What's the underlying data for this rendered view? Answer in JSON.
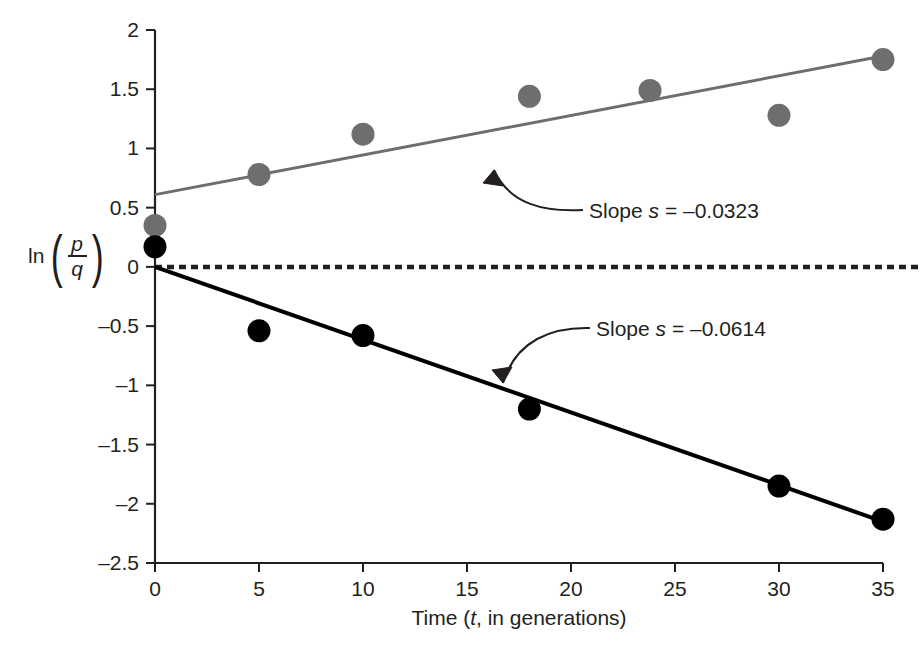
{
  "chart_data": {
    "type": "scatter",
    "title": "",
    "xlabel": "Time (t, in generations)",
    "xlabel_parts": {
      "pre": "Time (",
      "italic": "t",
      "post": ", in generations)"
    },
    "ylabel": "ln(p/q)",
    "ylabel_parts": {
      "fn": "ln",
      "numerator": "p",
      "denominator": "q"
    },
    "xlim": [
      0,
      35
    ],
    "ylim": [
      -2.5,
      2
    ],
    "xticks": [
      0,
      5,
      10,
      15,
      20,
      25,
      30,
      35
    ],
    "xtick_labels": [
      "0",
      "5",
      "10",
      "15",
      "20",
      "25",
      "30",
      "35"
    ],
    "yticks": [
      -2.5,
      -2,
      -1.5,
      -1,
      -0.5,
      0,
      0.5,
      1,
      1.5,
      2
    ],
    "ytick_labels": [
      "-2.5",
      "-2",
      "-1.5",
      "-1",
      "-0.5",
      "0",
      "0.5",
      "1",
      "1.5",
      "2"
    ],
    "grid": false,
    "legend": "none",
    "reference_line": {
      "y": 0,
      "style": "dashed",
      "color": "#231f20"
    },
    "series": [
      {
        "name": "gray-series",
        "marker": "circle",
        "color": "#6e6e6e",
        "points": [
          {
            "x": 0,
            "y": 0.35
          },
          {
            "x": 5,
            "y": 0.78
          },
          {
            "x": 10,
            "y": 1.12
          },
          {
            "x": 18,
            "y": 1.44
          },
          {
            "x": 23.8,
            "y": 1.49
          },
          {
            "x": 30,
            "y": 1.28
          },
          {
            "x": 35,
            "y": 1.75
          }
        ],
        "fit_line": {
          "x0": 0,
          "y0": 0.61,
          "x1": 35,
          "y1": 1.78,
          "color": "#6e6e6e"
        }
      },
      {
        "name": "black-series",
        "marker": "circle",
        "color": "#000000",
        "points": [
          {
            "x": 0,
            "y": 0.17
          },
          {
            "x": 5,
            "y": -0.54
          },
          {
            "x": 10,
            "y": -0.58
          },
          {
            "x": 18,
            "y": -1.2
          },
          {
            "x": 30,
            "y": -1.85
          },
          {
            "x": 35,
            "y": -2.13
          }
        ],
        "fit_line": {
          "x0": 0,
          "y0": 0,
          "x1": 35,
          "y1": -2.15,
          "color": "#000000"
        }
      }
    ],
    "annotations": [
      {
        "name": "slope-gray",
        "text": "Slope s = –0.0323",
        "parts": {
          "pre": "Slope ",
          "italic": "s",
          "post": " = –0.0323"
        },
        "value": -0.0323,
        "target_series": "gray-series"
      },
      {
        "name": "slope-black",
        "text": "Slope s = –0.0614",
        "parts": {
          "pre": "Slope ",
          "italic": "s",
          "post": " = –0.0614"
        },
        "value": -0.0614,
        "target_series": "black-series"
      }
    ]
  }
}
